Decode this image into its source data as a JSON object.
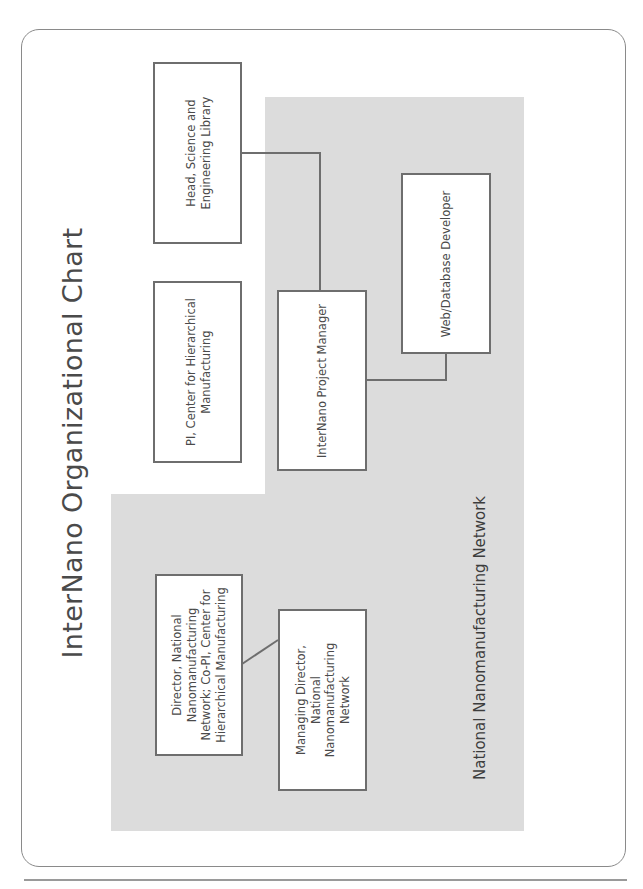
{
  "title": "InterNano Organizational Chart",
  "region_label": "National Nanomanufacturing Network",
  "colors": {
    "region_fill": "#dcdcdc",
    "box_border": "#6e6e6e",
    "connector": "#6e6e6e",
    "frame_border": "#8a8a8a"
  },
  "nodes": {
    "head_library": {
      "label": "Head, Science and\nEngineering Library"
    },
    "pi_chm": {
      "label": "PI, Center for Hierarchical\nManufacturing"
    },
    "project_manager": {
      "label": "InterNano Project Manager"
    },
    "web_db_developer": {
      "label": "Web/Database Developer"
    },
    "director_nnn": {
      "label": "Director, National\nNanomanufacturing\nNetwork; Co-PI, Center for\nHierarchical Manufacturing"
    },
    "managing_director_nnn": {
      "label": "Managing Director,\nNational\nNanomanufacturing\nNetwork"
    }
  },
  "edges": [
    {
      "from": "Head, Science and Engineering Library",
      "to": "InterNano Project Manager"
    },
    {
      "from": "InterNano Project Manager",
      "to": "Web/Database Developer"
    },
    {
      "from": "Director, National Nanomanufacturing Network; Co-PI, Center for Hierarchical Manufacturing",
      "to": "Managing Director, National Nanomanufacturing Network"
    }
  ]
}
